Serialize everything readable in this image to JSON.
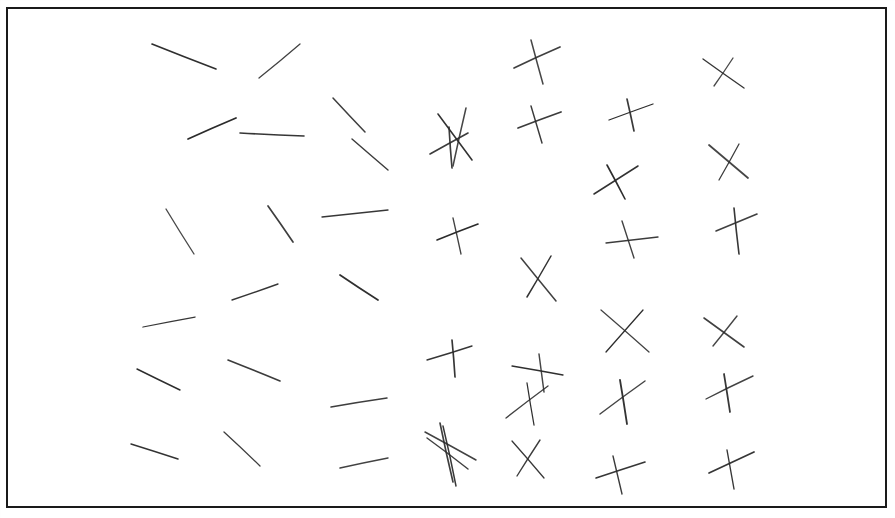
{
  "figure": {
    "background_color": "#ffffff",
    "stroke_color": "#2b2b2b",
    "border_color": "#1a1a1a",
    "border_width": 2,
    "canvas": {
      "width": 895,
      "height": 518
    },
    "frame": {
      "x": 7,
      "y": 8,
      "width": 879,
      "height": 499
    }
  },
  "chart_data": {
    "type": "scatter",
    "subtitle": "",
    "xlabel": "",
    "ylabel": "",
    "grid": false,
    "legend_position": "none",
    "xlim": [
      0,
      895
    ],
    "ylim": [
      0,
      518
    ],
    "columns": 7,
    "rows": 6,
    "items": [
      {
        "id": "r1c1",
        "kind": "single",
        "strokes": [
          [
            152,
            44,
            216,
            69
          ]
        ]
      },
      {
        "id": "r1c2",
        "kind": "single",
        "strokes": [
          [
            259,
            78,
            300,
            44
          ]
        ]
      },
      {
        "id": "r1c3",
        "kind": "single",
        "strokes": [
          [
            333,
            98,
            365,
            132
          ]
        ]
      },
      {
        "id": "r1c4",
        "kind": "cross",
        "strokes": [
          [
            438,
            114,
            472,
            160
          ],
          [
            466,
            108,
            453,
            166
          ]
        ]
      },
      {
        "id": "r1c5",
        "kind": "cross",
        "strokes": [
          [
            514,
            68,
            560,
            47
          ],
          [
            531,
            40,
            543,
            84
          ]
        ]
      },
      {
        "id": "r1c6",
        "kind": "cross",
        "strokes": [
          [
            609,
            120,
            653,
            104
          ],
          [
            627,
            99,
            634,
            131
          ]
        ]
      },
      {
        "id": "r1c7",
        "kind": "cross",
        "strokes": [
          [
            703,
            59,
            744,
            88
          ],
          [
            733,
            58,
            714,
            86
          ]
        ]
      },
      {
        "id": "r2c1",
        "kind": "single",
        "strokes": [
          [
            188,
            139,
            236,
            118
          ]
        ]
      },
      {
        "id": "r2c2",
        "kind": "single",
        "strokes": [
          [
            240,
            133,
            304,
            136
          ]
        ]
      },
      {
        "id": "r2c3",
        "kind": "single",
        "strokes": [
          [
            352,
            139,
            388,
            170
          ]
        ]
      },
      {
        "id": "r2c4",
        "kind": "cross",
        "strokes": [
          [
            430,
            154,
            468,
            133
          ],
          [
            449,
            127,
            452,
            168
          ]
        ]
      },
      {
        "id": "r2c5",
        "kind": "cross",
        "strokes": [
          [
            518,
            128,
            561,
            112
          ],
          [
            531,
            106,
            542,
            143
          ]
        ]
      },
      {
        "id": "r2c6",
        "kind": "cross",
        "strokes": [
          [
            594,
            194,
            638,
            166
          ],
          [
            607,
            165,
            625,
            199
          ]
        ]
      },
      {
        "id": "r2c7",
        "kind": "cross",
        "strokes": [
          [
            709,
            145,
            748,
            178
          ],
          [
            739,
            144,
            719,
            180
          ]
        ]
      },
      {
        "id": "r3c1",
        "kind": "single",
        "strokes": [
          [
            166,
            209,
            194,
            254
          ]
        ]
      },
      {
        "id": "r3c2",
        "kind": "single",
        "strokes": [
          [
            268,
            206,
            293,
            242
          ]
        ]
      },
      {
        "id": "r3c3",
        "kind": "single",
        "strokes": [
          [
            322,
            217,
            388,
            210
          ]
        ]
      },
      {
        "id": "r3c4",
        "kind": "cross",
        "strokes": [
          [
            437,
            240,
            478,
            224
          ],
          [
            453,
            218,
            461,
            254
          ]
        ]
      },
      {
        "id": "r3c5",
        "kind": "cross",
        "strokes": [
          [
            521,
            258,
            556,
            301
          ],
          [
            551,
            256,
            527,
            297
          ]
        ]
      },
      {
        "id": "r3c6",
        "kind": "cross",
        "strokes": [
          [
            606,
            243,
            658,
            237
          ],
          [
            622,
            221,
            634,
            258
          ]
        ]
      },
      {
        "id": "r3c7",
        "kind": "cross",
        "strokes": [
          [
            716,
            231,
            757,
            214
          ],
          [
            734,
            208,
            739,
            254
          ]
        ]
      },
      {
        "id": "r4c1",
        "kind": "single",
        "strokes": [
          [
            143,
            327,
            195,
            317
          ]
        ]
      },
      {
        "id": "r4c2",
        "kind": "single",
        "strokes": [
          [
            232,
            300,
            278,
            284
          ]
        ]
      },
      {
        "id": "r4c3",
        "kind": "single",
        "strokes": [
          [
            340,
            275,
            378,
            300
          ]
        ]
      },
      {
        "id": "r4c4",
        "kind": "cross",
        "strokes": [
          [
            427,
            360,
            472,
            346
          ],
          [
            452,
            340,
            455,
            377
          ]
        ]
      },
      {
        "id": "r4c5",
        "kind": "cross",
        "strokes": [
          [
            512,
            366,
            563,
            375
          ],
          [
            539,
            354,
            544,
            392
          ]
        ]
      },
      {
        "id": "r4c6",
        "kind": "cross",
        "strokes": [
          [
            601,
            310,
            649,
            352
          ],
          [
            643,
            310,
            606,
            352
          ]
        ]
      },
      {
        "id": "r4c7",
        "kind": "cross",
        "strokes": [
          [
            704,
            318,
            744,
            347
          ],
          [
            737,
            316,
            713,
            346
          ]
        ]
      },
      {
        "id": "r5c1",
        "kind": "single",
        "strokes": [
          [
            137,
            369,
            180,
            390
          ]
        ]
      },
      {
        "id": "r5c2",
        "kind": "single",
        "strokes": [
          [
            228,
            360,
            280,
            381
          ]
        ]
      },
      {
        "id": "r5c3",
        "kind": "single",
        "strokes": [
          [
            331,
            407,
            387,
            398
          ]
        ]
      },
      {
        "id": "r5c4",
        "kind": "cross",
        "strokes": [
          [
            425,
            432,
            476,
            460
          ],
          [
            440,
            423,
            453,
            482
          ]
        ]
      },
      {
        "id": "r5c5",
        "kind": "cross",
        "strokes": [
          [
            506,
            418,
            548,
            386
          ],
          [
            527,
            383,
            534,
            425
          ]
        ]
      },
      {
        "id": "r5c6",
        "kind": "cross",
        "strokes": [
          [
            600,
            414,
            645,
            381
          ],
          [
            620,
            380,
            627,
            424
          ]
        ]
      },
      {
        "id": "r5c7",
        "kind": "cross",
        "strokes": [
          [
            706,
            399,
            753,
            376
          ],
          [
            724,
            374,
            730,
            412
          ]
        ]
      },
      {
        "id": "r6c1",
        "kind": "single",
        "strokes": [
          [
            131,
            444,
            178,
            459
          ]
        ]
      },
      {
        "id": "r6c2",
        "kind": "single",
        "strokes": [
          [
            224,
            432,
            260,
            466
          ]
        ]
      },
      {
        "id": "r6c3",
        "kind": "single",
        "strokes": [
          [
            340,
            468,
            388,
            458
          ]
        ]
      },
      {
        "id": "r6c4",
        "kind": "cross",
        "strokes": [
          [
            427,
            438,
            468,
            469
          ],
          [
            443,
            426,
            456,
            486
          ]
        ]
      },
      {
        "id": "r6c5",
        "kind": "cross",
        "strokes": [
          [
            512,
            441,
            544,
            478
          ],
          [
            540,
            440,
            517,
            476
          ]
        ]
      },
      {
        "id": "r6c6",
        "kind": "cross",
        "strokes": [
          [
            596,
            478,
            645,
            462
          ],
          [
            613,
            456,
            622,
            494
          ]
        ]
      },
      {
        "id": "r6c7",
        "kind": "cross",
        "strokes": [
          [
            709,
            473,
            754,
            452
          ],
          [
            727,
            450,
            734,
            489
          ]
        ]
      }
    ]
  }
}
